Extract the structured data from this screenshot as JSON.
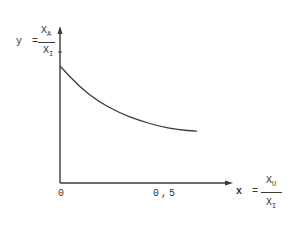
{
  "chart_data": {
    "type": "line",
    "title": "",
    "xlabel": {
      "lhs": "x",
      "eq": "=",
      "num": "X",
      "num_sub": "U",
      "den": "X",
      "den_sub": "I"
    },
    "ylabel": {
      "lhs": "y",
      "eq": "=",
      "num": "X",
      "num_sub": "A",
      "den": "X",
      "den_sub": "I"
    },
    "x_ticks": [
      "0",
      "0,5"
    ],
    "x_tick_values": [
      0,
      0.5
    ],
    "y_ticks": [],
    "grid": false,
    "legend": null,
    "series": [
      {
        "name": "y(x)",
        "x": [
          0.0,
          0.1,
          0.2,
          0.3,
          0.4,
          0.5,
          0.6,
          0.7
        ],
        "y": [
          0.78,
          0.64,
          0.54,
          0.47,
          0.42,
          0.38,
          0.355,
          0.345
        ]
      }
    ],
    "xlim": [
      0,
      0.8
    ],
    "ylim": [
      0,
      1.0
    ]
  },
  "axis_color": "#3a3a3a",
  "curve_color": "#3a3a3a"
}
